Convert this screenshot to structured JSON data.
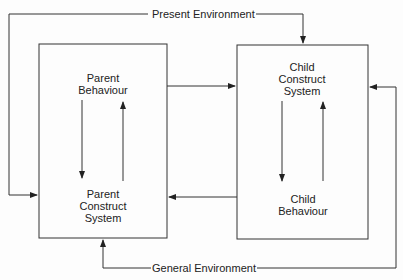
{
  "diagram": {
    "edges_labels": {
      "top": "Present Environment",
      "bottom": "General Environment"
    },
    "parent_box": {
      "top_label": [
        "Parent",
        "Behaviour"
      ],
      "bottom_label": [
        "Parent",
        "Construct",
        "System"
      ]
    },
    "child_box": {
      "top_label": [
        "Child",
        "Construct",
        "System"
      ],
      "bottom_label": [
        "Child",
        "Behaviour"
      ]
    },
    "colors": {
      "line": "#222222",
      "background": "#fdfdfd"
    }
  }
}
